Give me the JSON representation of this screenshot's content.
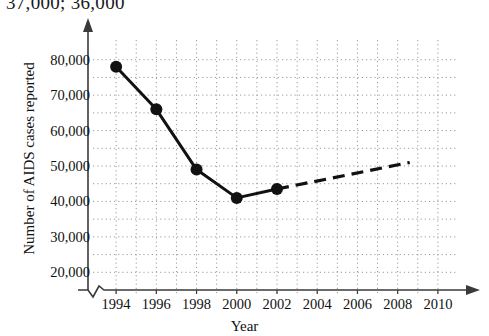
{
  "annotation": {
    "top_note": "37,000; 36,000"
  },
  "chart_data": {
    "type": "line",
    "title": "",
    "xlabel": "Year",
    "ylabel": "Number of AIDS cases reported",
    "xlim": [
      1993,
      2011
    ],
    "ylim": [
      15000,
      85000
    ],
    "xticks": [
      "1994",
      "1996",
      "1998",
      "2000",
      "2002",
      "2004",
      "2006",
      "2008",
      "2010"
    ],
    "xtick_values": [
      1994,
      1996,
      1998,
      2000,
      2002,
      2004,
      2006,
      2008,
      2010
    ],
    "yticks": [
      "20,000",
      "30,000",
      "40,000",
      "50,000",
      "60,000",
      "70,000",
      "80,000"
    ],
    "ytick_values": [
      20000,
      30000,
      40000,
      50000,
      60000,
      70000,
      80000
    ],
    "grid": true,
    "grid_style": "dotted",
    "grid_minor_y_step": 5000,
    "grid_minor_x_step": 1,
    "legend": "none",
    "axis_break_x": true,
    "axis_arrows": true,
    "series": [
      {
        "name": "Reported AIDS cases (actual)",
        "style": "solid",
        "marker": "circle",
        "x": [
          1994,
          1996,
          1998,
          2000,
          2002
        ],
        "values": [
          78000,
          66000,
          49000,
          41000,
          43500
        ]
      },
      {
        "name": "Projected trend",
        "style": "dashed",
        "marker": "none",
        "x": [
          2002,
          2008.6
        ],
        "values": [
          43500,
          51000
        ]
      }
    ]
  },
  "colors": {
    "line": "#111111",
    "grid": "#9a9a9a",
    "axis": "#3a3a3a",
    "background": "#ffffff"
  }
}
